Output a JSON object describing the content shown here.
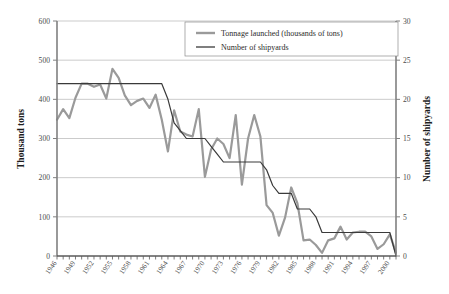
{
  "chart_data": {
    "type": "line",
    "title": "",
    "xlabel": "",
    "ylabel": "Thousand tons",
    "y2label": "Number of shipyards",
    "ylim": [
      0,
      600
    ],
    "y2lim": [
      0,
      30
    ],
    "xlim": [
      1946,
      2001
    ],
    "grid": true,
    "legend_position": "top-center",
    "yticks": [
      0,
      100,
      200,
      300,
      400,
      500,
      600
    ],
    "y2ticks": [
      0,
      5,
      10,
      15,
      20,
      25,
      30
    ],
    "xticks": [
      1946,
      1949,
      1952,
      1955,
      1958,
      1961,
      1964,
      1967,
      1970,
      1973,
      1976,
      1979,
      1982,
      1985,
      1988,
      1991,
      1994,
      1997,
      2000
    ],
    "x": [
      1946,
      1947,
      1948,
      1949,
      1950,
      1951,
      1952,
      1953,
      1954,
      1955,
      1956,
      1957,
      1958,
      1959,
      1960,
      1961,
      1962,
      1963,
      1964,
      1965,
      1966,
      1967,
      1968,
      1969,
      1970,
      1971,
      1972,
      1973,
      1974,
      1975,
      1976,
      1977,
      1978,
      1979,
      1980,
      1981,
      1982,
      1983,
      1984,
      1985,
      1986,
      1987,
      1988,
      1989,
      1990,
      1991,
      1992,
      1993,
      1994,
      1995,
      1996,
      1997,
      1998,
      1999,
      2000,
      2001
    ],
    "series": [
      {
        "name": "Tonnage launched (thousands of tons)",
        "axis": "left",
        "color": "#9a9a9a",
        "width": 2.2,
        "values": [
          348,
          375,
          352,
          404,
          440,
          440,
          432,
          438,
          402,
          478,
          455,
          410,
          385,
          396,
          402,
          378,
          412,
          348,
          267,
          372,
          318,
          310,
          305,
          375,
          202,
          272,
          300,
          286,
          250,
          360,
          182,
          300,
          360,
          305,
          130,
          110,
          52,
          98,
          175,
          135,
          40,
          42,
          28,
          8,
          40,
          45,
          75,
          42,
          60,
          62,
          62,
          50,
          18,
          30,
          55,
          8
        ]
      },
      {
        "name": "Number of shipyards",
        "axis": "right",
        "color": "#3a3a3a",
        "width": 1.2,
        "values": [
          22,
          22,
          22,
          22,
          22,
          22,
          22,
          22,
          22,
          22,
          22,
          22,
          22,
          22,
          22,
          22,
          22,
          22,
          20,
          17,
          16,
          15,
          15,
          15,
          15,
          14,
          13,
          12,
          12,
          12,
          12,
          12,
          12,
          12,
          11,
          9,
          8,
          8,
          8,
          6,
          6,
          6,
          5,
          3,
          3,
          3,
          3,
          3,
          3,
          3,
          3,
          3,
          3,
          3,
          3,
          0
        ]
      }
    ]
  },
  "legend": {
    "items": [
      {
        "label": "Tonnage launched (thousands of tons)",
        "color": "#9a9a9a"
      },
      {
        "label": "Number of shipyards",
        "color": "#3a3a3a"
      }
    ]
  },
  "axes": {
    "left_title": "Thousand tons",
    "right_title": "Number of shipyards"
  }
}
